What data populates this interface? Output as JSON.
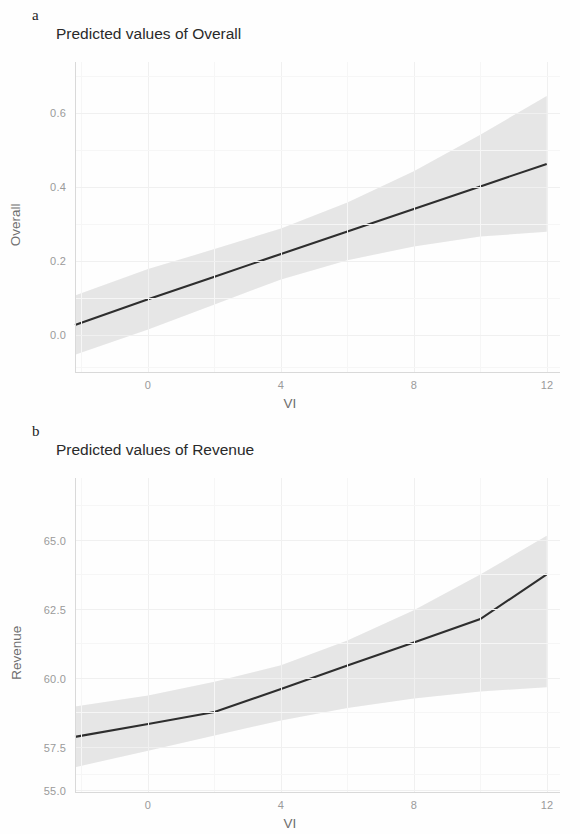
{
  "figure": {
    "background": "#fefefe",
    "line_color": "#2e2e2e",
    "ribbon_color": "#d6d6d6",
    "grid_color": "#f0f0f0"
  },
  "panels": [
    {
      "tag": "a",
      "title": "Predicted values of Overall",
      "xlabel": "VI",
      "ylabel": "Overall",
      "xticks": [
        "0",
        "4",
        "8",
        "12"
      ],
      "yticks": [
        "0.6",
        "0.4",
        "0.2",
        "0.0"
      ]
    },
    {
      "tag": "b",
      "title": "Predicted values of Revenue",
      "xlabel": "VI",
      "ylabel": "Revenue",
      "xticks": [
        "0",
        "4",
        "8",
        "12"
      ],
      "yticks": [
        "65.0",
        "62.5",
        "60.0",
        "57.5",
        "55.0"
      ]
    }
  ],
  "chart_data": [
    {
      "type": "line",
      "panel": "a",
      "title": "Predicted values of Overall",
      "xlabel": "VI",
      "ylabel": "Overall",
      "xlim": [
        -2.2,
        12.4
      ],
      "ylim": [
        -0.12,
        0.72
      ],
      "xticks": [
        0,
        4,
        8,
        12
      ],
      "yticks": [
        0.0,
        0.2,
        0.4,
        0.6
      ],
      "grid": true,
      "legend": "none",
      "series": [
        {
          "name": "Predicted Overall",
          "x": [
            -2.2,
            0,
            2,
            4,
            6,
            8,
            10,
            12
          ],
          "values": [
            0.007,
            0.077,
            0.138,
            0.2,
            0.261,
            0.322,
            0.383,
            0.444
          ]
        }
      ],
      "confidence_band": {
        "name": "95% CI",
        "x": [
          -2.2,
          0,
          2,
          4,
          6,
          8,
          10,
          12
        ],
        "lower": [
          -0.073,
          -0.005,
          0.063,
          0.131,
          0.183,
          0.22,
          0.247,
          0.26
        ],
        "upper": [
          0.087,
          0.159,
          0.213,
          0.269,
          0.339,
          0.424,
          0.523,
          0.628
        ]
      }
    },
    {
      "type": "line",
      "panel": "b",
      "title": "Predicted values of Revenue",
      "xlabel": "VI",
      "ylabel": "Revenue",
      "xlim": [
        -2.2,
        12.4
      ],
      "ylim": [
        55.0,
        66.4
      ],
      "xticks": [
        0,
        4,
        8,
        12
      ],
      "yticks": [
        55.0,
        57.5,
        60.0,
        62.5,
        65.0
      ],
      "grid": true,
      "legend": "none",
      "series": [
        {
          "name": "Predicted Revenue",
          "x": [
            -2.2,
            0,
            2,
            4,
            6,
            8,
            10,
            12
          ],
          "values": [
            57.0,
            57.47,
            57.9,
            58.74,
            59.59,
            60.43,
            61.28,
            62.9
          ]
        }
      ],
      "confidence_band": {
        "name": "95% CI",
        "x": [
          -2.2,
          0,
          2,
          4,
          6,
          8,
          10,
          12
        ],
        "lower": [
          55.9,
          56.5,
          57.05,
          57.6,
          58.05,
          58.4,
          58.65,
          58.8
        ],
        "upper": [
          58.1,
          58.5,
          59.0,
          59.6,
          60.5,
          61.6,
          62.9,
          64.3
        ]
      }
    }
  ]
}
